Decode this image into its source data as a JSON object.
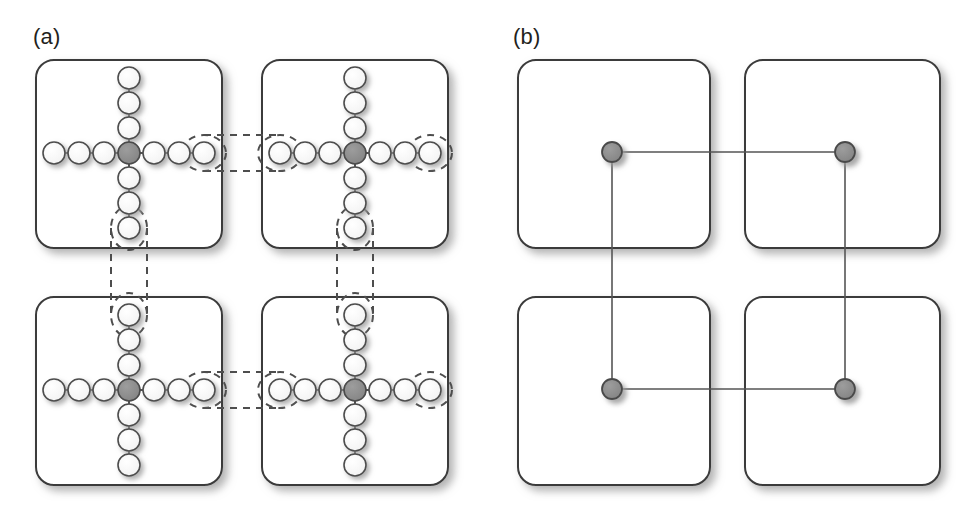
{
  "figure": {
    "caption_labels": [
      {
        "id": "panel-a",
        "text": "(a)",
        "x": 33,
        "y": 24
      },
      {
        "id": "panel-b",
        "text": "(b)",
        "x": 513,
        "y": 24
      }
    ],
    "colors": {
      "outline": "#3b3b3b",
      "node_fill": "#ffffff",
      "node_stroke": "#4d4d4d",
      "center_node_fill": "#8c8c8c",
      "center_node_stroke": "#4a4a4a",
      "dot_fill": "#8c8c8c",
      "dot_stroke": "#4a4a4a",
      "dashed_stroke": "#4d4d4d",
      "link_stroke": "#555555",
      "shadow": "#b8b8b8",
      "background": "#ffffff",
      "text": "#231f20"
    },
    "geometry": {
      "box_radius": 18,
      "box_stroke_width": 2,
      "node_radius": 11,
      "node_stroke_width": 1.6,
      "center_node_radius": 11,
      "dot_radius": 10,
      "dot_stroke_width": 1.8,
      "link_stroke_width": 1.6,
      "dash_pattern": "7,6"
    }
  },
  "panel_a": {
    "label": "(a)",
    "description": "Four rounded tiles each containing a plus-shaped cluster of circles with a shaded centre node; dashed ovals pair boundary nodes across neighbouring tiles.",
    "boxes": [
      {
        "name": "tile-top-left",
        "x": 36,
        "y": 60,
        "w": 186,
        "h": 188
      },
      {
        "name": "tile-top-right",
        "x": 262,
        "y": 60,
        "w": 186,
        "h": 188
      },
      {
        "name": "tile-bottom-left",
        "x": 36,
        "y": 297,
        "w": 186,
        "h": 188
      },
      {
        "name": "tile-bottom-right",
        "x": 262,
        "y": 297,
        "w": 186,
        "h": 188
      }
    ],
    "cross": {
      "arm_count": 3,
      "spacing": 25,
      "offsets_horizontal": [
        -3,
        -2,
        -1,
        0,
        1,
        2,
        3
      ],
      "offsets_vertical": [
        -3,
        -2,
        -1,
        0,
        1,
        2,
        3
      ]
    },
    "cross_centers": [
      {
        "name": "cross-top-left",
        "cx": 129,
        "cy": 153
      },
      {
        "name": "cross-top-right",
        "cx": 355,
        "cy": 153
      },
      {
        "name": "cross-bottom-left",
        "cx": 129,
        "cy": 390
      },
      {
        "name": "cross-bottom-right",
        "cx": 355,
        "cy": 390
      }
    ],
    "dashed_ovals": [
      {
        "name": "ghost-oval-tl-right",
        "cx": 204,
        "cy": 153,
        "rx": 22,
        "ry": 18
      },
      {
        "name": "ghost-oval-tr-left",
        "cx": 280,
        "cy": 153,
        "rx": 22,
        "ry": 18
      },
      {
        "name": "ghost-oval-tr-right",
        "cx": 430,
        "cy": 153,
        "rx": 22,
        "ry": 18
      },
      {
        "name": "ghost-oval-bl-right",
        "cx": 204,
        "cy": 390,
        "rx": 22,
        "ry": 18
      },
      {
        "name": "ghost-oval-br-left",
        "cx": 280,
        "cy": 390,
        "rx": 22,
        "ry": 18
      },
      {
        "name": "ghost-oval-br-right",
        "cx": 430,
        "cy": 390,
        "rx": 22,
        "ry": 18
      },
      {
        "name": "ghost-oval-tl-bottom",
        "cx": 129,
        "cy": 228,
        "rx": 18,
        "ry": 22
      },
      {
        "name": "ghost-oval-bl-top",
        "cx": 129,
        "cy": 315,
        "rx": 18,
        "ry": 22
      },
      {
        "name": "ghost-oval-tr-bottom",
        "cx": 355,
        "cy": 228,
        "rx": 18,
        "ry": 22
      },
      {
        "name": "ghost-oval-br-top",
        "cx": 355,
        "cy": 315,
        "rx": 18,
        "ry": 22
      }
    ],
    "dashed_links": [
      {
        "name": "dash-h-top-upper",
        "x1": 204,
        "y1": 135,
        "x2": 280,
        "y2": 135
      },
      {
        "name": "dash-h-top-lower",
        "x1": 204,
        "y1": 171,
        "x2": 280,
        "y2": 171
      },
      {
        "name": "dash-h-bot-upper",
        "x1": 204,
        "y1": 372,
        "x2": 280,
        "y2": 372
      },
      {
        "name": "dash-h-bot-lower",
        "x1": 204,
        "y1": 408,
        "x2": 280,
        "y2": 408
      },
      {
        "name": "dash-v-left-a",
        "x1": 111,
        "y1": 228,
        "x2": 111,
        "y2": 315
      },
      {
        "name": "dash-v-left-b",
        "x1": 147,
        "y1": 228,
        "x2": 147,
        "y2": 315
      },
      {
        "name": "dash-v-right-a",
        "x1": 337,
        "y1": 228,
        "x2": 337,
        "y2": 315
      },
      {
        "name": "dash-v-right-b",
        "x1": 373,
        "y1": 228,
        "x2": 373,
        "y2": 315
      }
    ]
  },
  "panel_b": {
    "label": "(b)",
    "description": "Four rounded tiles each holding one shaded dot; straight links join the dots horizontally and vertically across tile boundaries.",
    "boxes": [
      {
        "name": "tile-top-left",
        "x": 518,
        "y": 60,
        "w": 192,
        "h": 188
      },
      {
        "name": "tile-top-right",
        "x": 745,
        "y": 60,
        "w": 195,
        "h": 188
      },
      {
        "name": "tile-bottom-left",
        "x": 518,
        "y": 297,
        "w": 192,
        "h": 188
      },
      {
        "name": "tile-bottom-right",
        "x": 745,
        "y": 297,
        "w": 195,
        "h": 188
      }
    ],
    "dots": [
      {
        "name": "dot-top-left",
        "cx": 612,
        "cy": 152
      },
      {
        "name": "dot-top-right",
        "cx": 845,
        "cy": 152
      },
      {
        "name": "dot-bottom-left",
        "cx": 612,
        "cy": 389
      },
      {
        "name": "dot-bottom-right",
        "cx": 845,
        "cy": 389
      }
    ],
    "links": [
      {
        "name": "link-top-horizontal",
        "x1": 612,
        "y1": 152,
        "x2": 845,
        "y2": 152
      },
      {
        "name": "link-bottom-horizontal",
        "x1": 612,
        "y1": 389,
        "x2": 845,
        "y2": 389
      },
      {
        "name": "link-left-vertical",
        "x1": 612,
        "y1": 152,
        "x2": 612,
        "y2": 389
      },
      {
        "name": "link-right-vertical",
        "x1": 845,
        "y1": 152,
        "x2": 845,
        "y2": 389
      }
    ]
  }
}
